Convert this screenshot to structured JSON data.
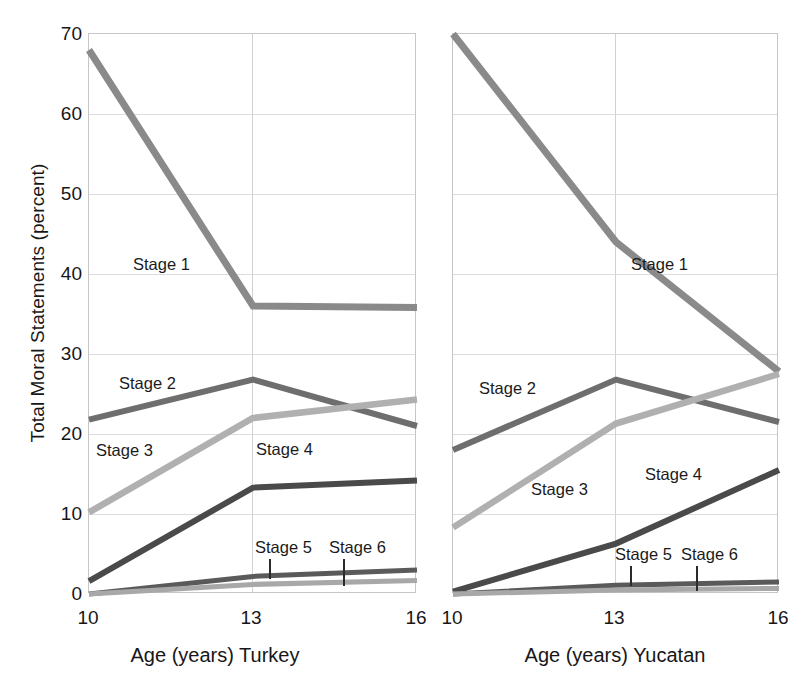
{
  "axes": {
    "ylabel": "Total Moral Statements (percent)",
    "yticks": [
      "70",
      "60",
      "50",
      "40",
      "30",
      "20",
      "10",
      "0"
    ],
    "ytick_values": [
      70,
      60,
      50,
      40,
      30,
      20,
      10,
      0
    ],
    "ylim": [
      0,
      70
    ],
    "xticks": [
      "10",
      "13",
      "16"
    ],
    "xtick_values": [
      10,
      13,
      16
    ],
    "xlim": [
      10,
      16
    ]
  },
  "panels": {
    "left": {
      "xlabel": "Age (years) Turkey",
      "labels": {
        "stage1": "Stage 1",
        "stage2": "Stage 2",
        "stage3": "Stage 3",
        "stage4": "Stage 4",
        "stage5": "Stage 5",
        "stage6": "Stage 6"
      }
    },
    "right": {
      "xlabel": "Age (years) Yucatan",
      "labels": {
        "stage1": "Stage 1",
        "stage2": "Stage 2",
        "stage3": "Stage 3",
        "stage4": "Stage 4",
        "stage5": "Stage 5",
        "stage6": "Stage 6"
      }
    }
  },
  "colors": {
    "stage1": "#8a8a8a",
    "stage2": "#6e6e6e",
    "stage3": "#b0b0b0",
    "stage4": "#4a4a4a",
    "stage5": "#5a5a5a",
    "stage6": "#a8a8a8",
    "gridline": "#dcdcdc",
    "axis": "#c6c6c6",
    "text": "#171717"
  },
  "chart_data": [
    {
      "type": "line",
      "title": "Age (years) Turkey",
      "xlabel": "Age (years) Turkey",
      "ylabel": "Total Moral Statements (percent)",
      "x": [
        10,
        13,
        16
      ],
      "xlim": [
        10,
        16
      ],
      "ylim": [
        0,
        70
      ],
      "grid": true,
      "legend": "inline-labels",
      "series": [
        {
          "name": "Stage 1",
          "values": [
            68,
            36,
            35.8
          ]
        },
        {
          "name": "Stage 2",
          "values": [
            21.8,
            26.8,
            21
          ]
        },
        {
          "name": "Stage 3",
          "values": [
            10.2,
            22,
            24.3
          ]
        },
        {
          "name": "Stage 4",
          "values": [
            1.6,
            13.3,
            14.2
          ]
        },
        {
          "name": "Stage 5",
          "values": [
            0,
            2.2,
            3
          ]
        },
        {
          "name": "Stage 6",
          "values": [
            0,
            1.2,
            1.7
          ]
        }
      ]
    },
    {
      "type": "line",
      "title": "Age (years) Yucatan",
      "xlabel": "Age (years) Yucatan",
      "ylabel": "Total Moral Statements (percent)",
      "x": [
        10,
        13,
        16
      ],
      "xlim": [
        10,
        16
      ],
      "ylim": [
        0,
        70
      ],
      "grid": true,
      "legend": "inline-labels",
      "series": [
        {
          "name": "Stage 1",
          "values": [
            70,
            44,
            27.8
          ]
        },
        {
          "name": "Stage 2",
          "values": [
            18,
            26.8,
            21.5
          ]
        },
        {
          "name": "Stage 3",
          "values": [
            8.3,
            21.3,
            27.5
          ]
        },
        {
          "name": "Stage 4",
          "values": [
            0.3,
            6.3,
            15.5
          ]
        },
        {
          "name": "Stage 5",
          "values": [
            0,
            1.1,
            1.5
          ]
        },
        {
          "name": "Stage 6",
          "values": [
            0,
            0.5,
            0.7
          ]
        }
      ]
    }
  ]
}
